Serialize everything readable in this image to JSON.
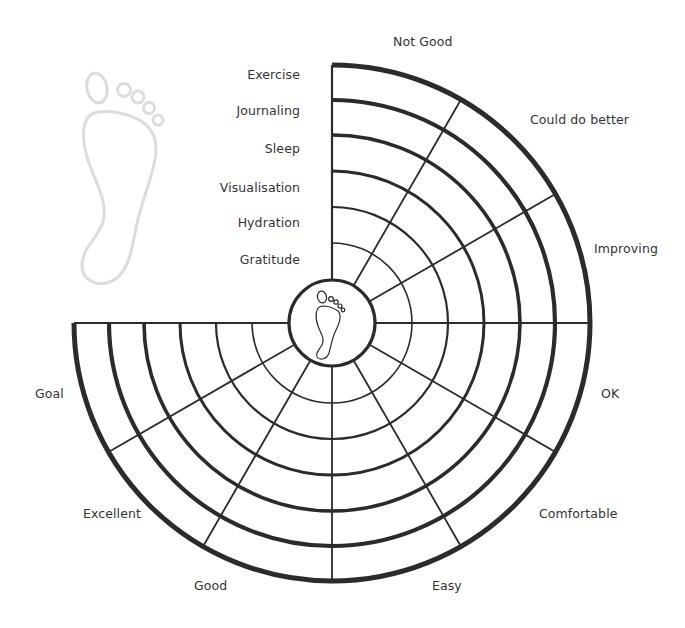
{
  "diagram": {
    "center": {
      "x": 332,
      "y": 323
    },
    "inner_radius": 43,
    "ring_radii": [
      80,
      116,
      152,
      188,
      223,
      258
    ],
    "ring_strokes": [
      1.6,
      2.2,
      3.0,
      3.6,
      4.2,
      5.0
    ],
    "sectors": 9,
    "sector_angle_deg": 30,
    "start_angle_deg": -90,
    "sweep_deg": 270,
    "line_color": "#2b2b2b",
    "ghost_foot_color": "#dcdcdc",
    "text_color": "#333333"
  },
  "categories": [
    {
      "label": "Exercise",
      "y": 76
    },
    {
      "label": "Journaling",
      "y": 112
    },
    {
      "label": "Sleep",
      "y": 150
    },
    {
      "label": "Visualisation",
      "y": 189
    },
    {
      "label": "Hydration",
      "y": 224
    },
    {
      "label": "Gratitude",
      "y": 261
    }
  ],
  "scale_labels": [
    {
      "label": "Not Good",
      "x": 393,
      "y": 43
    },
    {
      "label": "Could do better",
      "x": 530,
      "y": 121
    },
    {
      "label": "Improving",
      "x": 594,
      "y": 250
    },
    {
      "label": "OK",
      "x": 601,
      "y": 395
    },
    {
      "label": "Comfortable",
      "x": 539,
      "y": 515
    },
    {
      "label": "Easy",
      "x": 432,
      "y": 587
    },
    {
      "label": "Good",
      "x": 194,
      "y": 587
    },
    {
      "label": "Excellent",
      "x": 83,
      "y": 515
    },
    {
      "label": "Goal",
      "x": 35,
      "y": 395
    }
  ],
  "icons": {
    "center": "footprint-icon",
    "decorative": "footprint-outline-icon"
  }
}
